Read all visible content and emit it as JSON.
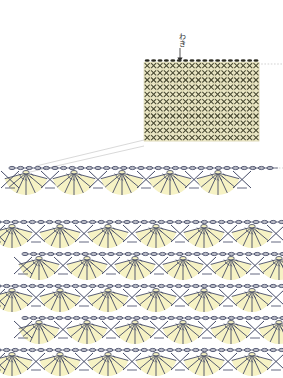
{
  "document": {
    "type": "crochet-pattern-chart",
    "title": "",
    "background_color": "#ffffff"
  },
  "colors": {
    "stitch_line": "#3c4260",
    "grid_stitch": "#4a4a33",
    "fan_fill": "#f6f2c4",
    "grid_fill": "#efeccb",
    "grid_line": "#cfc9a0",
    "chain_dark": "#2a2a20",
    "guide_line": "#bfbfbf",
    "text": "#2b2b2b"
  },
  "annotations": {
    "waki_label": "わき",
    "waki_arrow": "down-arrow"
  },
  "grid_chart": {
    "name": "single-crochet-grid",
    "x": 144,
    "y": 62,
    "columns": 18,
    "rows": 11,
    "cell_w": 6.4,
    "cell_h": 7.2,
    "stitch_symbol": "×",
    "top_edge_symbol": "chain-oval-filled",
    "top_edge_count": 18
  },
  "detail_row": {
    "name": "single-fan-row-detail",
    "x": 14,
    "y": 160,
    "fan_count": 5,
    "chain_arcs": 16,
    "fan_spokes": 7,
    "width": 245
  },
  "pattern_block": {
    "name": "repeating-fan-pattern",
    "x": 10,
    "y": 222,
    "rows": 5,
    "fans_per_row": 5,
    "row_height": 32,
    "fan_spokes": 7,
    "stagger_px": 27
  },
  "guides": {
    "diagonal_count": 2,
    "horizontal_dotted": [
      {
        "name": "grid-top-extension",
        "y": 64,
        "x1": 258,
        "x2": 283
      },
      {
        "name": "detail-row-extension",
        "y": 168,
        "x1": 250,
        "x2": 283
      }
    ]
  }
}
